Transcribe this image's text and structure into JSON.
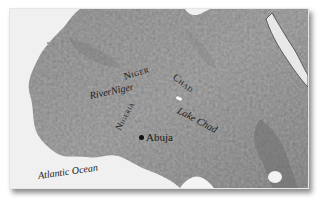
{
  "map": {
    "style": "grayscale shaded relief",
    "region": "West Africa",
    "colors": {
      "sea": "#f2f2f2",
      "land": "#9a9a9a",
      "land_dark": "#7a7a7a",
      "land_light": "#b8b8b8",
      "text": "#1a1a1a",
      "frame_shadow": "rgba(0,0,0,0.45)"
    },
    "labels": {
      "niger_country": "Niger",
      "river_niger": "RiverNiger",
      "chad_country": "Chad",
      "lake_chad": "Lake Chad",
      "nigeria_country": "Nigeria",
      "abuja_city": "Abuja",
      "atlantic_ocean": "Atlantic Ocean"
    },
    "markers": [
      {
        "name": "Abuja",
        "type": "capital-city-dot"
      },
      {
        "name": "Lake Chad",
        "type": "lake"
      }
    ]
  }
}
